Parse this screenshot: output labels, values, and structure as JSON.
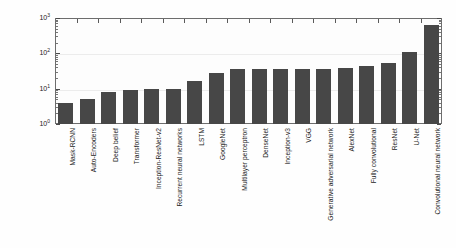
{
  "chart_data": {
    "type": "bar",
    "title": "",
    "xlabel": "",
    "ylabel": "Number of Entries",
    "yscale": "log",
    "ylim": [
      1,
      1000
    ],
    "ytick_labels": [
      "10<sup>0</sup>",
      "10<sup>1</sup>",
      "10<sup>2</sup>",
      "10<sup>3</sup>"
    ],
    "ytick_values": [
      1,
      10,
      100,
      1000
    ],
    "grid": false,
    "legend": "none",
    "bar_color": "#474747",
    "categories": [
      "Mask-RCNN",
      "Auto-Encoders",
      "Deep belief",
      "Transformer",
      "Inception-ResNet-v2",
      "Recurrent neural networks",
      "LSTM",
      "GoogleNet",
      "Multilayer perceptron",
      "DenseNet",
      "Inception-v3",
      "VGG",
      "Generative adversarial network",
      "AlexNet",
      "Fully convolutional",
      "ResNet",
      "U-Net",
      "Convolutional neural network"
    ],
    "values": [
      4,
      5,
      8,
      9,
      10,
      10,
      16,
      27,
      35,
      36,
      36,
      36,
      37,
      38,
      45,
      55,
      110,
      620
    ]
  },
  "axis": {
    "y_title": "Number of Entries",
    "y_labels": [
      {
        "text": "10",
        "exp": "3",
        "value": 1000
      },
      {
        "text": "10",
        "exp": "2",
        "value": 100
      },
      {
        "text": "10",
        "exp": "1",
        "value": 10
      },
      {
        "text": "10",
        "exp": "0",
        "value": 1
      }
    ]
  }
}
